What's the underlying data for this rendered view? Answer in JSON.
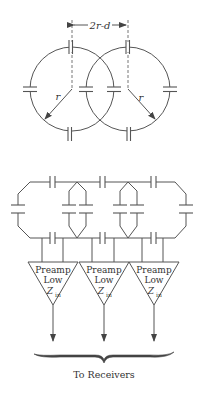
{
  "figure": {
    "type": "coil-array-schematic",
    "colors": {
      "stroke": "#555555",
      "text": "#333333",
      "background": "#ffffff"
    }
  },
  "top_diagram": {
    "dimension_label": "2r-d",
    "radius_label_left": "r",
    "radius_label_right": "r",
    "circles": [
      {
        "name": "left-coil",
        "cx": 72,
        "cy": 89,
        "r": 42
      },
      {
        "name": "right-coil",
        "cx": 128,
        "cy": 89,
        "r": 42
      }
    ]
  },
  "bottom_diagram": {
    "preamps": [
      {
        "line1": "Preamp",
        "line2": "Low",
        "z": "Z",
        "z_sub": "in"
      },
      {
        "line1": "Preamp",
        "line2": "Low",
        "z": "Z",
        "z_sub": "in"
      },
      {
        "line1": "Preamp",
        "line2": "Low",
        "z": "Z",
        "z_sub": "in"
      }
    ],
    "output_label": "To Receivers"
  }
}
